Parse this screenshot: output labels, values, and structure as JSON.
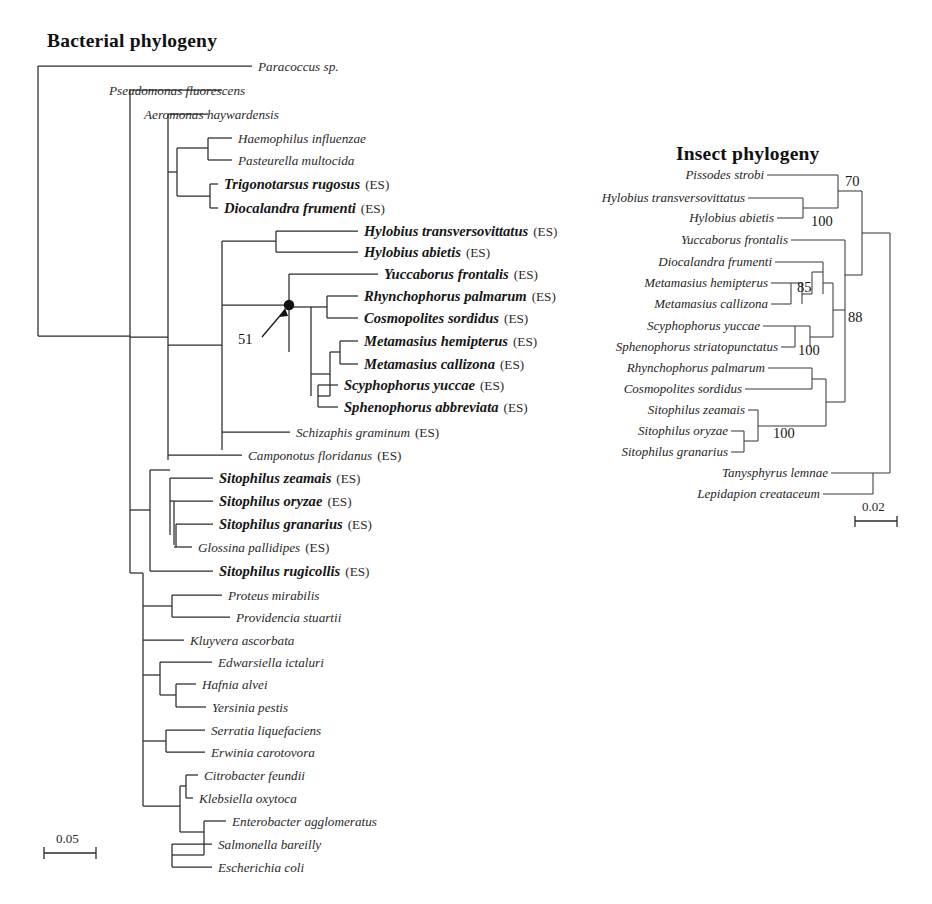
{
  "figure": {
    "type": "phylogenetic-tree-comparison",
    "panels": [
      {
        "id": "bacterial",
        "title": "Bacterial phylogeny",
        "scale_bar": "0.05"
      },
      {
        "id": "insect",
        "title": "Insect phylogeny",
        "scale_bar": "0.02"
      }
    ]
  },
  "bacterial": {
    "title": "Bacterial phylogeny",
    "scale_bar_label": "0.05",
    "node_support_label": "51",
    "es_suffix": "(ES)",
    "taxa": [
      {
        "name": "Paracoccus sp.",
        "bold": false,
        "es": false,
        "y": 66,
        "tip_x": 252
      },
      {
        "name": "Pseudomonas fluorescens",
        "bold": false,
        "es": false,
        "y": 90,
        "tip_x": 103
      },
      {
        "name": "Aeromonas haywardensis",
        "bold": false,
        "es": false,
        "y": 114,
        "tip_x": 138
      },
      {
        "name": "Haemophilus influenzae",
        "bold": false,
        "es": false,
        "y": 138,
        "tip_x": 232
      },
      {
        "name": "Pasteurella multocida",
        "bold": false,
        "es": false,
        "y": 160,
        "tip_x": 232
      },
      {
        "name": "Trigonotarsus rugosus",
        "bold": true,
        "es": true,
        "y": 184,
        "tip_x": 218
      },
      {
        "name": "Diocalandra frumenti",
        "bold": true,
        "es": true,
        "y": 208,
        "tip_x": 218
      },
      {
        "name": "Hylobius transversovittatus",
        "bold": true,
        "es": true,
        "y": 231,
        "tip_x": 358
      },
      {
        "name": "Hylobius abietis",
        "bold": true,
        "es": true,
        "y": 252,
        "tip_x": 358
      },
      {
        "name": "Yuccaborus frontalis",
        "bold": true,
        "es": true,
        "y": 274,
        "tip_x": 378
      },
      {
        "name": "Rhynchophorus palmarum",
        "bold": true,
        "es": true,
        "y": 296,
        "tip_x": 358
      },
      {
        "name": "Cosmopolites sordidus",
        "bold": true,
        "es": true,
        "y": 318,
        "tip_x": 358
      },
      {
        "name": "Metamasius hemipterus",
        "bold": true,
        "es": true,
        "y": 341,
        "tip_x": 358
      },
      {
        "name": "Metamasius callizona",
        "bold": true,
        "es": true,
        "y": 364,
        "tip_x": 358
      },
      {
        "name": "Scyphophorus yuccae",
        "bold": true,
        "es": true,
        "y": 385,
        "tip_x": 338
      },
      {
        "name": "Sphenophorus abbreviata",
        "bold": true,
        "es": true,
        "y": 407,
        "tip_x": 338
      },
      {
        "name": "Schizaphis graminum",
        "bold": false,
        "es": true,
        "y": 432,
        "tip_x": 290
      },
      {
        "name": "Camponotus floridanus",
        "bold": false,
        "es": true,
        "y": 455,
        "tip_x": 242
      },
      {
        "name": "Sitophilus zeamais",
        "bold": true,
        "es": true,
        "y": 478,
        "tip_x": 213
      },
      {
        "name": "Sitophilus oryzae",
        "bold": true,
        "es": true,
        "y": 501,
        "tip_x": 213
      },
      {
        "name": "Sitophilus granarius",
        "bold": true,
        "es": true,
        "y": 524,
        "tip_x": 213
      },
      {
        "name": "Glossina pallidipes",
        "bold": false,
        "es": true,
        "y": 547,
        "tip_x": 192
      },
      {
        "name": "Sitophilus rugicollis",
        "bold": true,
        "es": true,
        "y": 571,
        "tip_x": 213
      },
      {
        "name": "Proteus mirabilis",
        "bold": false,
        "es": false,
        "y": 595,
        "tip_x": 222
      },
      {
        "name": "Providencia stuartii",
        "bold": false,
        "es": false,
        "y": 617,
        "tip_x": 230
      },
      {
        "name": "Kluyvera ascorbata",
        "bold": false,
        "es": false,
        "y": 640,
        "tip_x": 184
      },
      {
        "name": "Edwarsiella ictaluri",
        "bold": false,
        "es": false,
        "y": 662,
        "tip_x": 212
      },
      {
        "name": "Hafnia alvei",
        "bold": false,
        "es": false,
        "y": 684,
        "tip_x": 196
      },
      {
        "name": "Yersinia pestis",
        "bold": false,
        "es": false,
        "y": 707,
        "tip_x": 206
      },
      {
        "name": "Serratia liquefaciens",
        "bold": false,
        "es": false,
        "y": 730,
        "tip_x": 205
      },
      {
        "name": "Erwinia carotovora",
        "bold": false,
        "es": false,
        "y": 752,
        "tip_x": 205
      },
      {
        "name": "Citrobacter feundii",
        "bold": false,
        "es": false,
        "y": 775,
        "tip_x": 198
      },
      {
        "name": "Klebsiella oxytoca",
        "bold": false,
        "es": false,
        "y": 798,
        "tip_x": 193
      },
      {
        "name": "Enterobacter agglomeratus",
        "bold": false,
        "es": false,
        "y": 821,
        "tip_x": 226
      },
      {
        "name": "Salmonella bareilly",
        "bold": false,
        "es": false,
        "y": 844,
        "tip_x": 212
      },
      {
        "name": "Escherichia coli",
        "bold": false,
        "es": false,
        "y": 867,
        "tip_x": 212
      }
    ]
  },
  "insect": {
    "title": "Insect phylogeny",
    "scale_bar_label": "0.02",
    "support_values": [
      "70",
      "100",
      "85",
      "100",
      "88",
      "100"
    ],
    "taxa": [
      {
        "name": "Pissodes strobi",
        "y": 175,
        "label_end": 764,
        "tip_x": 838
      },
      {
        "name": "Hylobius transversovittatus",
        "y": 198,
        "label_end": 745,
        "tip_x": 803
      },
      {
        "name": "Hylobius abietis",
        "y": 218,
        "label_end": 774,
        "tip_x": 803
      },
      {
        "name": "Yuccaborus frontalis",
        "y": 240,
        "label_end": 788,
        "tip_x": 845
      },
      {
        "name": "Diocalandra frumenti",
        "y": 262,
        "label_end": 772,
        "tip_x": 823
      },
      {
        "name": "Metamasius hemipterus",
        "y": 283,
        "label_end": 768,
        "tip_x": 802
      },
      {
        "name": "Metamasius callizona",
        "y": 304,
        "label_end": 768,
        "tip_x": 791
      },
      {
        "name": "Scyphophorus yuccae",
        "y": 326,
        "label_end": 760,
        "tip_x": 810
      },
      {
        "name": "Sphenophorus striatopunctatus",
        "y": 347,
        "label_end": 778,
        "tip_x": 795
      },
      {
        "name": "Rhynchophorus palmarum",
        "y": 368,
        "label_end": 765,
        "tip_x": 812
      },
      {
        "name": "Cosmopolites sordidus",
        "y": 389,
        "label_end": 742,
        "tip_x": 812
      },
      {
        "name": "Sitophilus zeamais",
        "y": 410,
        "label_end": 745,
        "tip_x": 758
      },
      {
        "name": "Sitophilus oryzae",
        "y": 431,
        "label_end": 728,
        "tip_x": 744
      },
      {
        "name": "Sitophilus granarius",
        "y": 452,
        "label_end": 728,
        "tip_x": 744
      },
      {
        "name": "Tanysphyrus lemnae",
        "y": 473,
        "label_end": 828,
        "tip_x": 890
      },
      {
        "name": "Lepidapion creataceum",
        "y": 494,
        "label_end": 820,
        "tip_x": 873
      }
    ]
  },
  "colors": {
    "line": "#2b2b2b",
    "text": "#2a2a2a",
    "bold_text": "#151515",
    "background": "#ffffff"
  }
}
